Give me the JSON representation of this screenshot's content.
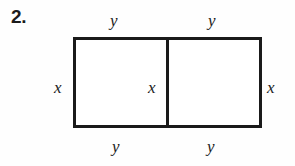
{
  "figure": {
    "problem_number": "2.",
    "shape": "rectangle-split-into-two-squares",
    "stroke_color": "#1a1a1a",
    "fill_color": "#ffffff",
    "background_color": "#fefefe",
    "labels": {
      "top_left": "y",
      "top_right": "y",
      "left_side": "x",
      "middle_divider": "x",
      "right_side": "x",
      "bottom_left": "y",
      "bottom_right": "y"
    }
  }
}
